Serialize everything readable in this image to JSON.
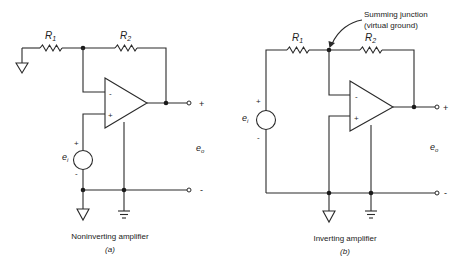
{
  "figure": {
    "panel_a": {
      "title": "Noninverting amplifier",
      "tag": "(a)",
      "r1_label": "R",
      "r1_sub": "1",
      "r2_label": "R",
      "r2_sub": "2",
      "input_label": "e",
      "input_sub": "i",
      "output_label": "e",
      "output_sub": "o",
      "input_plus": "+",
      "input_minus": "-",
      "output_plus": "+",
      "output_minus": "-",
      "opamp_inverting": "-",
      "opamp_noninverting": "+"
    },
    "panel_b": {
      "title": "Inverting amplifier",
      "tag": "(b)",
      "r1_label": "R",
      "r1_sub": "1",
      "r2_label": "R",
      "r2_sub": "2",
      "input_label": "e",
      "input_sub": "i",
      "output_label": "e",
      "output_sub": "o",
      "input_plus": "+",
      "input_minus": "-",
      "output_plus": "+",
      "output_minus": "-",
      "opamp_inverting": "-",
      "opamp_noninverting": "+",
      "annotation_line1": "Summing junction",
      "annotation_line2": "(virtual ground)"
    }
  }
}
